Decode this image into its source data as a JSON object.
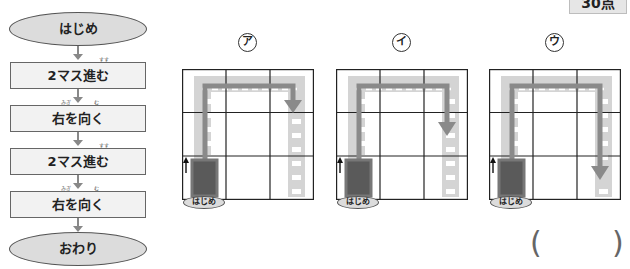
{
  "score": {
    "label": "30点"
  },
  "flowchart": {
    "start": "はじめ",
    "steps": [
      {
        "text": "2マス進む",
        "ruby": "すす",
        "ruby_target": "進"
      },
      {
        "text": "右を向く",
        "ruby_migi": "みぎ",
        "ruby_mu": "む"
      },
      {
        "text": "2マス進む",
        "ruby": "すす",
        "ruby_target": "進"
      },
      {
        "text": "右を向く",
        "ruby_migi": "みぎ",
        "ruby_mu": "む"
      }
    ],
    "end": "おわり"
  },
  "options": [
    {
      "label": "ア",
      "start_label": "はじめ",
      "grid": "3x3",
      "route": "up 2, right 2, down to middle row",
      "arrow_end_row": 1
    },
    {
      "label": "イ",
      "start_label": "はじめ",
      "grid": "3x3",
      "route": "up 2, right 2, down to middle row (lower)",
      "arrow_end_row": 1.5
    },
    {
      "label": "ウ",
      "start_label": "はじめ",
      "grid": "3x3",
      "route": "up 2, right 2, down 2",
      "arrow_end_row": 2.5
    }
  ],
  "answer": {
    "open": "(",
    "close": ")",
    "value": ""
  },
  "colors": {
    "road": "#d4d4d4",
    "route_arrow": "#8a8a8a",
    "car": "#555555",
    "grid_line": "#222222"
  }
}
